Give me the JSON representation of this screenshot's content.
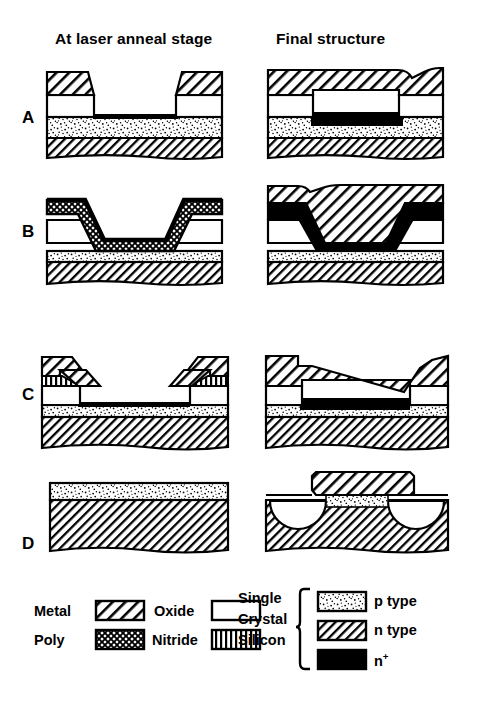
{
  "figure": {
    "type": "technical-cross-section-diagram",
    "title": "",
    "column_headers": [
      {
        "id": "left",
        "label": "At laser anneal stage"
      },
      {
        "id": "right",
        "label": "Final structure"
      }
    ],
    "row_labels": [
      {
        "id": "A",
        "label": "A"
      },
      {
        "id": "B",
        "label": "B"
      },
      {
        "id": "C",
        "label": "C"
      },
      {
        "id": "D",
        "label": "D"
      }
    ],
    "rows": [
      {
        "id": "A",
        "left_description": "Two metal contacts on oxide islands flanking an open window; p type layer over n type substrate with thin n+ line at the window bottom.",
        "right_description": "Continuous metal layer dipping into the window; thick n+ region formed in the p type layer under the contact."
      },
      {
        "id": "B",
        "left_description": "Conformal poly layer draped over a stepped oxide trench; thin p type layer over n type substrate.",
        "right_description": "Poly converted to n+ (solid black) with metal layer above following the same step profile."
      },
      {
        "id": "C",
        "left_description": "Tapered stepped metal pads with nitride strips over oxide; thin black n+ line at the surface of the p type layer.",
        "right_description": "Continuous tapered metal layer spanning the recess with a wide n+ region beneath it."
      },
      {
        "id": "D",
        "left_description": "Uniform p type layer on an n type substrate with no patterning.",
        "right_description": "Metal stripe over the surface with two white melted/etched semicircular zones flanking an n+ region in the substrate."
      }
    ]
  },
  "legend": {
    "materials": [
      {
        "id": "metal",
        "label": "Metal",
        "pattern": "diagonal-hatch-backslash",
        "color": "#000000"
      },
      {
        "id": "oxide",
        "label": "Oxide",
        "pattern": "blank-white",
        "color": "#ffffff"
      },
      {
        "id": "poly",
        "label": "Poly",
        "pattern": "cross-hatch-mesh",
        "color": "#000000"
      },
      {
        "id": "nitride",
        "label": "Nitride",
        "pattern": "vertical-lines",
        "color": "#000000"
      }
    ],
    "silicon_group": {
      "lines": [
        "Single",
        "Crystal",
        "Silicon"
      ],
      "items": [
        {
          "id": "p-type",
          "label": "p type",
          "pattern": "stipple-dots",
          "color": "#000000"
        },
        {
          "id": "n-type",
          "label": "n type",
          "pattern": "diagonal-hatch-forward",
          "color": "#000000"
        },
        {
          "id": "n-plus",
          "label_base": "n",
          "label_sup": "+",
          "pattern": "solid-black",
          "color": "#000000"
        }
      ]
    }
  }
}
